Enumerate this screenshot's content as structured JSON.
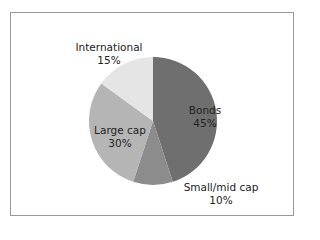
{
  "chart_data": {
    "type": "pie",
    "title": "",
    "slices": [
      {
        "label": "Bonds",
        "value": 45,
        "pct": "45%",
        "color": "#6f6f6f"
      },
      {
        "label": "Small/mid cap",
        "value": 10,
        "pct": "10%",
        "color": "#8c8c8c"
      },
      {
        "label": "Large cap",
        "value": 30,
        "pct": "30%",
        "color": "#b5b5b5"
      },
      {
        "label": "International",
        "value": 15,
        "pct": "15%",
        "color": "#e5e5e5"
      }
    ],
    "start_angle": "top",
    "direction": "clockwise",
    "legend": "none"
  }
}
